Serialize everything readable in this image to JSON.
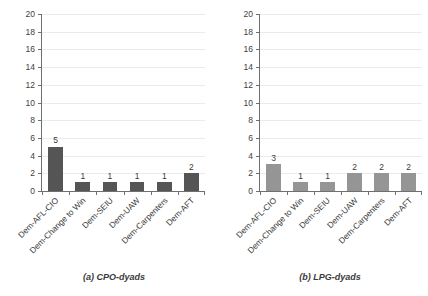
{
  "chart_data": [
    {
      "type": "bar",
      "title": "(a) CPO-dyads",
      "panel_id": "a",
      "categories": [
        "Dem-AFL-CIO",
        "Dem-Change to Win",
        "Dem-SEIU",
        "Dem-UAW",
        "Dem-Carpenters",
        "Dem-AFT"
      ],
      "values": [
        5,
        1,
        1,
        1,
        1,
        2
      ],
      "xlabel": "",
      "ylabel": "",
      "ylim": [
        0,
        20
      ],
      "ytick_values": [
        0,
        2,
        4,
        6,
        8,
        10,
        12,
        14,
        16,
        18,
        20
      ],
      "ytick_labels": [
        "0",
        "2",
        "4",
        "6",
        "8",
        "10",
        "12",
        "14",
        "16",
        "18",
        "20"
      ],
      "data_labels": [
        "5",
        "1",
        "1",
        "1",
        "1",
        "2"
      ],
      "bar_color": "#555555",
      "grid": true,
      "grid_color": "#ebebeb",
      "axis_color": "#6f6f6f",
      "legend": "none",
      "xtick_label_rotation": -45
    },
    {
      "type": "bar",
      "title": "(b) LPG-dyads",
      "panel_id": "b",
      "categories": [
        "Dem-AFL-CIO",
        "Dem-Change to Win",
        "Dem-SEIU",
        "Dem-UAW",
        "Dem-Carpenters",
        "Dem-AFT"
      ],
      "values": [
        3,
        1,
        1,
        2,
        2,
        2
      ],
      "xlabel": "",
      "ylabel": "",
      "ylim": [
        0,
        20
      ],
      "ytick_values": [
        0,
        2,
        4,
        6,
        8,
        10,
        12,
        14,
        16,
        18,
        20
      ],
      "ytick_labels": [
        "0",
        "2",
        "4",
        "6",
        "8",
        "10",
        "12",
        "14",
        "16",
        "18",
        "20"
      ],
      "data_labels": [
        "3",
        "1",
        "1",
        "2",
        "2",
        "2"
      ],
      "bar_color": "#959595",
      "grid": true,
      "grid_color": "#ebebeb",
      "axis_color": "#6f6f6f",
      "legend": "none",
      "xtick_label_rotation": -45
    }
  ],
  "figure": {
    "background": "#ffffff",
    "panels": [
      {
        "caption": "(a) CPO-dyads"
      },
      {
        "caption": "(b) LPG-dyads"
      }
    ]
  }
}
